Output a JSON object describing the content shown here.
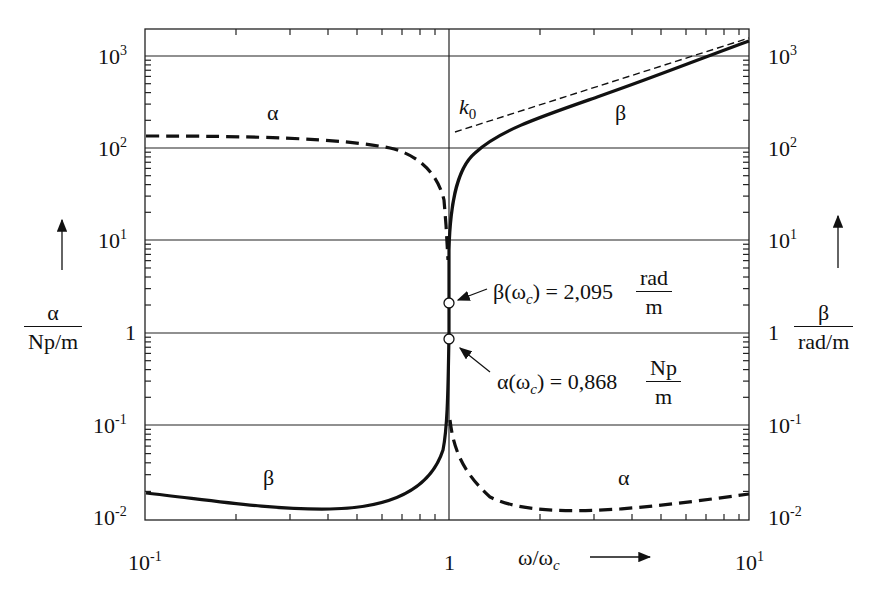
{
  "chart_data": {
    "type": "line",
    "title": "",
    "xlabel": "ω/ω_c",
    "ylabel_left": "α / (Np/m)",
    "ylabel_right": "β / (rad/m)",
    "x_scale": "log",
    "y_scale": "log",
    "xlim": [
      0.1,
      10
    ],
    "ylim": [
      0.01,
      2000
    ],
    "x_ticks": [
      "10^-1",
      "1",
      "10^1"
    ],
    "y_ticks": [
      "10^-2",
      "10^-1",
      "1",
      "10^1",
      "10^2",
      "10^3"
    ],
    "grid": "horizontal at decades, vertical at ω/ω_c = 1",
    "series": [
      {
        "name": "α",
        "style": "dashed",
        "x": [
          0.1,
          0.3,
          0.6,
          0.8,
          0.95,
          0.99,
          1.0,
          1.01,
          1.1,
          1.5,
          2.5,
          5,
          10
        ],
        "y": [
          140,
          135,
          110,
          80,
          30,
          5,
          0.868,
          0.1,
          0.04,
          0.018,
          0.014,
          0.016,
          0.022
        ]
      },
      {
        "name": "β",
        "style": "solid",
        "x": [
          0.1,
          0.2,
          0.4,
          0.7,
          0.9,
          0.99,
          1.0,
          1.01,
          1.05,
          1.2,
          2,
          5,
          8,
          10
        ],
        "y": [
          0.02,
          0.016,
          0.013,
          0.016,
          0.03,
          0.1,
          2.095,
          20,
          60,
          100,
          200,
          600,
          1000,
          1400
        ]
      },
      {
        "name": "k0",
        "style": "thin dashed asymptote",
        "x": [
          1.1,
          10
        ],
        "y": [
          150,
          1500
        ]
      }
    ],
    "annotations": [
      {
        "text": "β(ω_c) = 2,095 rad/m",
        "x": 1.0,
        "y": 2.095
      },
      {
        "text": "α(ω_c) = 0,868 Np/m",
        "x": 1.0,
        "y": 0.868
      },
      {
        "text": "k_0"
      },
      {
        "text": "α"
      },
      {
        "text": "β"
      }
    ]
  },
  "labels": {
    "y10_3": "10",
    "y10_2": "10",
    "y10_1": "10",
    "y1": "1",
    "y10_m1": "10",
    "y10_m2": "10",
    "e3": "3",
    "e2": "2",
    "e1": "1",
    "em1": "-1",
    "em2": "-2",
    "x_min": "10",
    "x_min_e": "-1",
    "x_mid": "1",
    "x_max": "10",
    "x_max_e": "1",
    "xlabel_w": "ω/ω",
    "xlabel_c": "c",
    "alpha": "α",
    "beta": "β",
    "k0_k": "k",
    "k0_0": "0",
    "left_unit": "Np/m",
    "right_unit": "rad/m",
    "beta_ann_pre": "β(ω",
    "beta_ann_post": ") = 2,095",
    "beta_ann_num": "rad",
    "beta_ann_den": "m",
    "alpha_ann_pre": "α(ω",
    "alpha_ann_post": ") = 0,868",
    "alpha_ann_num": "Np",
    "alpha_ann_den": "m",
    "sub_c": "c"
  }
}
